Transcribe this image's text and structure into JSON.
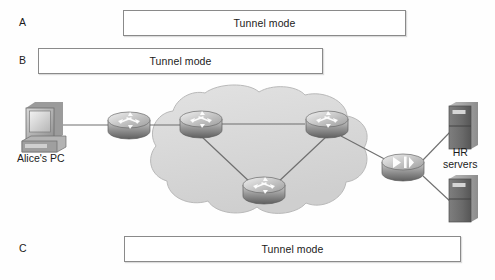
{
  "diagram": {
    "background_color": "#fefefe"
  },
  "spans": [
    {
      "id": "A",
      "label": "A",
      "text": "Tunnel mode",
      "description": "Tunnel spanning from the first WAN router to the HR-side router"
    },
    {
      "id": "B",
      "label": "B",
      "text": "Tunnel mode",
      "description": "Tunnel spanning from Alice's PC edge to the middle of the cloud"
    },
    {
      "id": "C",
      "label": "C",
      "text": "Tunnel mode",
      "description": "Tunnel spanning from the first WAN router to the HR servers"
    }
  ],
  "nodes": {
    "pc": {
      "label": "Alice's PC",
      "icon": "desktop-computer-icon"
    },
    "edge_router": {
      "label": "",
      "icon": "router-icon"
    },
    "cloud_router_left": {
      "label": "",
      "icon": "router-icon"
    },
    "cloud_router_right": {
      "label": "",
      "icon": "router-icon"
    },
    "cloud_router_bottom": {
      "label": "",
      "icon": "router-icon"
    },
    "hr_router": {
      "label": "",
      "icon": "router-icon"
    },
    "servers": {
      "label": "HR\nservers",
      "line1": "HR",
      "line2": "servers",
      "icon": "server-tower-icon"
    },
    "cloud": {
      "label": "",
      "icon": "network-cloud-icon"
    }
  },
  "colors": {
    "line": "#6f6f6f",
    "box_border": "#8a8a8a",
    "text": "#1b1b1b",
    "cloud_fill": "#d9d9d9",
    "cloud_stroke": "#b8b8b8",
    "device_light": "#e3e3e3",
    "device_mid": "#aeaeae",
    "device_dark": "#6e6e6e"
  }
}
